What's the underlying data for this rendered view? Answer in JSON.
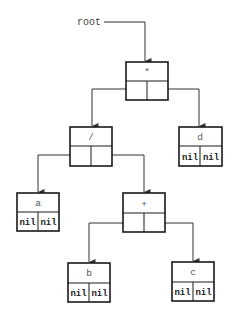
{
  "diagram": {
    "type": "binary-expression-tree",
    "root_label": "root",
    "nodes": [
      {
        "id": "n_mul",
        "label": "*",
        "left": "",
        "right": "",
        "x": 126,
        "y": 62,
        "w": 42,
        "h": 38
      },
      {
        "id": "n_div",
        "label": "/",
        "left": "",
        "right": "",
        "x": 70,
        "y": 127,
        "w": 42,
        "h": 39
      },
      {
        "id": "n_d",
        "label": "d",
        "left": "nil",
        "right": "nil",
        "x": 179,
        "y": 127,
        "w": 43,
        "h": 39
      },
      {
        "id": "n_a",
        "label": "a",
        "left": "nil",
        "right": "nil",
        "x": 17,
        "y": 193,
        "w": 42,
        "h": 38
      },
      {
        "id": "n_plus",
        "label": "+",
        "left": "",
        "right": "",
        "x": 123,
        "y": 193,
        "w": 42,
        "h": 39
      },
      {
        "id": "n_b",
        "label": "b",
        "left": "nil",
        "right": "nil",
        "x": 68,
        "y": 263,
        "w": 42,
        "h": 39
      },
      {
        "id": "n_c",
        "label": "c",
        "left": "nil",
        "right": "nil",
        "x": 172,
        "y": 262,
        "w": 42,
        "h": 39
      }
    ],
    "edges": [
      {
        "from": "root",
        "to": "n_mul",
        "side": "pointer"
      },
      {
        "from": "n_mul",
        "to": "n_div",
        "side": "left"
      },
      {
        "from": "n_mul",
        "to": "n_d",
        "side": "right"
      },
      {
        "from": "n_div",
        "to": "n_a",
        "side": "left"
      },
      {
        "from": "n_div",
        "to": "n_plus",
        "side": "right"
      },
      {
        "from": "n_plus",
        "to": "n_b",
        "side": "left"
      },
      {
        "from": "n_plus",
        "to": "n_c",
        "side": "right"
      }
    ],
    "colors": {
      "stroke": "#1a1a1a",
      "edge": "#333333",
      "label": "#555555",
      "background": "#ffffff"
    }
  }
}
